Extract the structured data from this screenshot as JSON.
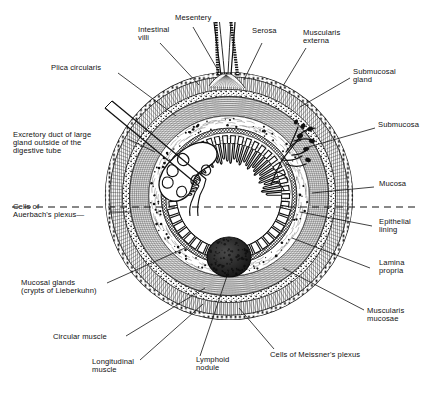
{
  "figure": {
    "type": "anatomical-diagram",
    "background_color": "#ffffff",
    "ink_color": "#111111",
    "center": {
      "x": 229,
      "y": 196
    },
    "outer_radius": 124
  },
  "labels": {
    "mesentery": "Mesentery",
    "intestinal_villi_line1": "Intestinal",
    "intestinal_villi_line2": "villi",
    "serosa": "Serosa",
    "muscularis_externa_line1": "Muscularis",
    "muscularis_externa_line2": "externa",
    "submucosal_gland_line1": "Submucosal",
    "submucosal_gland_line2": "gland",
    "submucosa": "Submucosa",
    "mucosa": "Mucosa",
    "epithelial_lining_line1": "Epithelial",
    "epithelial_lining_line2": "lining",
    "lamina_propria_line1": "Lamina",
    "lamina_propria_line2": "propria",
    "muscularis_mucosae_line1": "Muscularis",
    "muscularis_mucosae_line2": "mucosae",
    "meissner_plexus": "Cells of Meissner's plexus",
    "lymphoid_nodule_line1": "Lymphoid",
    "lymphoid_nodule_line2": "nodule",
    "longitudinal_muscle_line1": "Longitudinal",
    "longitudinal_muscle_line2": "muscle",
    "circular_muscle": "Circular muscle",
    "mucosal_glands_line1": "Mucosal glands",
    "mucosal_glands_line2": "(crypts of Lieberkuhn)",
    "auerbach_plexus_line1": "Cells of",
    "auerbach_plexus_line2": "Auerbach's plexus—",
    "excretory_duct_line1": "Excretory duct of large",
    "excretory_duct_line2": "gland outside of the",
    "excretory_duct_line3": "digestive tube",
    "plica_circularis": "Plica circularis"
  },
  "structures": {
    "layers": [
      "serosa",
      "muscularis externa (longitudinal)",
      "muscularis externa (circular)",
      "submucosa",
      "muscularis mucosae",
      "mucosa"
    ],
    "features": [
      "mesentery",
      "plica circularis",
      "intestinal villi",
      "submucosal gland",
      "lymphoid nodule",
      "crypts of Lieberkuhn",
      "excretory duct",
      "Auerbach's plexus",
      "Meissner's plexus"
    ]
  }
}
